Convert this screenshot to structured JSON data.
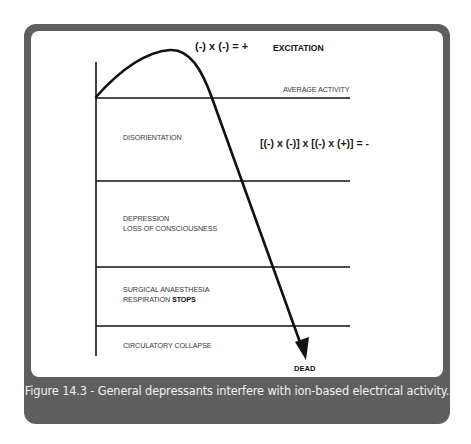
{
  "figure": {
    "caption": "Figure 14.3 - General depressants interfere with ion-based electrical activity.",
    "colors": {
      "frame": "#5f5f5f",
      "panel": "#ffffff",
      "ink": "#111111",
      "caption_text": "#f2f2f2"
    }
  },
  "diagram": {
    "formulas": {
      "excitation_formula": "(-) x (-) = +",
      "depression_formula": "[(-) x (-)] x [(-) x (+)] = -"
    },
    "states": {
      "excitation": "EXCITATION",
      "dead": "DEAD"
    },
    "reference_line_label": "AVERAGE ACTIVITY",
    "zones": [
      {
        "line1": "DISORIENTATION"
      },
      {
        "line1": "DEPRESSION",
        "line2": "LOSS OF CONSCIOUSNESS"
      },
      {
        "line1": "SURGICAL ANAESTHESIA",
        "line2_prefix": "RESPIRATION ",
        "line2_bold": "STOPS"
      },
      {
        "line1": "CIRCULATORY COLLAPSE"
      }
    ],
    "curve": {
      "description": "Activity rises above average (excitation), peaks, then falls through all depression levels to death (arrow)."
    }
  }
}
